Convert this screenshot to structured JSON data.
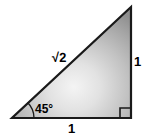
{
  "figure": {
    "type": "right-triangle-diagram",
    "background_color": "#ffffff",
    "outline_color": "#1a1a1a",
    "fill": {
      "style": "radial-gradient",
      "center_color": "#f2f2f2",
      "mid_color": "#b8b8b8",
      "edge_color": "#8c8c8c"
    },
    "labels": {
      "hypotenuse": "√2",
      "vertical_side": "1",
      "base_side": "1",
      "angle": "45°"
    },
    "markers": {
      "right_angle": "right-angle-square",
      "angle_arc": "45-degree-arc"
    },
    "vertices": {
      "bottom_left": [
        12,
        118
      ],
      "bottom_right": [
        131,
        118
      ],
      "top_right": [
        131,
        7
      ]
    }
  }
}
